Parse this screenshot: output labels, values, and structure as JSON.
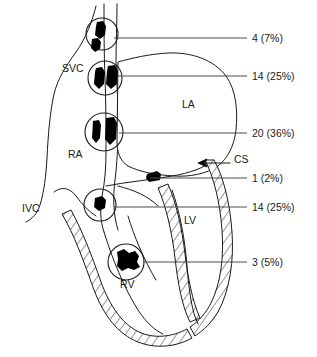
{
  "figure": {
    "anatomy_labels": [
      {
        "id": "svc",
        "text": "SVC",
        "x": 62,
        "y": 72
      },
      {
        "id": "ra",
        "text": "RA",
        "x": 68,
        "y": 158
      },
      {
        "id": "ivc",
        "text": "IVC",
        "x": 22,
        "y": 212
      },
      {
        "id": "la",
        "text": "LA",
        "x": 182,
        "y": 108
      },
      {
        "id": "lv",
        "text": "LV",
        "x": 184,
        "y": 224
      },
      {
        "id": "rv",
        "text": "RV",
        "x": 120,
        "y": 288
      },
      {
        "id": "cs",
        "text": "CS",
        "x": 234,
        "y": 163
      }
    ],
    "sites": [
      {
        "id": "site-1",
        "label": "4 (7%)",
        "count": 4,
        "percent": "7%",
        "circle": {
          "cx": 102,
          "cy": 34,
          "r": 16
        },
        "leader": {
          "x1": 114,
          "y1": 38,
          "x2": 247,
          "y2": 38
        },
        "label_x": 252,
        "label_y": 42
      },
      {
        "id": "site-2",
        "label": "14 (25%)",
        "count": 14,
        "percent": "25%",
        "circle": {
          "cx": 105,
          "cy": 78,
          "r": 17
        },
        "leader": {
          "x1": 118,
          "y1": 76,
          "x2": 247,
          "y2": 76
        },
        "label_x": 252,
        "label_y": 80
      },
      {
        "id": "site-3",
        "label": "20 (36%)",
        "count": 20,
        "percent": "36%",
        "circle": {
          "cx": 104,
          "cy": 132,
          "r": 19
        },
        "leader": {
          "x1": 119,
          "y1": 133,
          "x2": 247,
          "y2": 133
        },
        "label_x": 252,
        "label_y": 137
      },
      {
        "id": "site-4",
        "label": "1 (2%)",
        "count": 1,
        "percent": "2%",
        "circle": null,
        "leader": {
          "x1": 150,
          "y1": 178,
          "x2": 247,
          "y2": 178
        },
        "label_x": 252,
        "label_y": 182
      },
      {
        "id": "site-5",
        "label": "14 (25%)",
        "count": 14,
        "percent": "25%",
        "circle": {
          "cx": 100,
          "cy": 205,
          "r": 16
        },
        "leader": {
          "x1": 114,
          "y1": 207,
          "x2": 247,
          "y2": 207
        },
        "label_x": 252,
        "label_y": 211
      },
      {
        "id": "site-6",
        "label": "3 (5%)",
        "count": 3,
        "percent": "5%",
        "circle": {
          "cx": 126,
          "cy": 262,
          "r": 18
        },
        "leader": {
          "x1": 143,
          "y1": 262,
          "x2": 247,
          "y2": 262
        },
        "label_x": 252,
        "label_y": 266
      }
    ],
    "colors": {
      "ink": "#1a1a1a",
      "leader": "#4a4a4a",
      "lesion": "#000000",
      "background": "#ffffff"
    }
  }
}
